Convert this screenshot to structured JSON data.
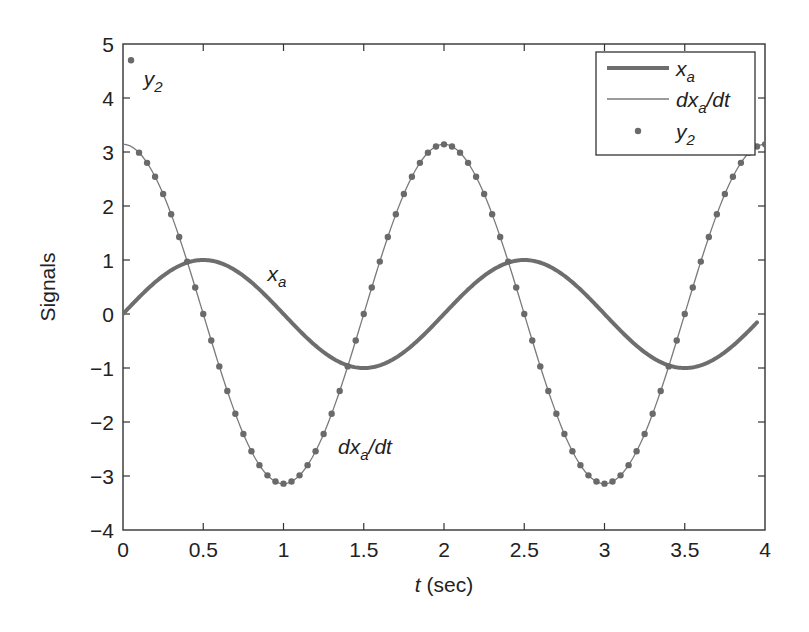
{
  "chart_data": {
    "type": "line",
    "title": "",
    "xlabel_var": "t",
    "xlabel_unit": " (sec)",
    "xlabel": "t (sec)",
    "ylabel": "Signals",
    "xlim": [
      0,
      4
    ],
    "ylim": [
      -4,
      5
    ],
    "grid": false,
    "legend_position": "upper right",
    "xticks": [
      0,
      0.5,
      1,
      1.5,
      2,
      2.5,
      3,
      3.5,
      4
    ],
    "xtick_labels": [
      "0",
      "0.5",
      "1",
      "1.5",
      "2",
      "2.5",
      "3",
      "3.5",
      "4"
    ],
    "yticks": [
      -4,
      -3,
      -2,
      -1,
      0,
      1,
      2,
      3,
      4,
      5
    ],
    "ytick_labels": [
      "−4",
      "−3",
      "−2",
      "−1",
      "0",
      "1",
      "2",
      "3",
      "4",
      "5"
    ],
    "series": [
      {
        "name": "x_a",
        "label_main": "x",
        "label_sub": "a",
        "label_tail": "",
        "style": "thick-line",
        "color": "#6e6e6e",
        "width": 4,
        "formula": "sin(pi*t)",
        "t_range": [
          0,
          3.95
        ],
        "x": [
          0,
          0.25,
          0.5,
          0.75,
          1.0,
          1.25,
          1.5,
          1.75,
          2.0,
          2.25,
          2.5,
          2.75,
          3.0,
          3.25,
          3.5,
          3.75,
          3.95
        ],
        "values": [
          0,
          0.71,
          1.0,
          0.71,
          0,
          -0.71,
          -1.0,
          -0.71,
          0,
          0.71,
          1.0,
          0.71,
          0,
          -0.71,
          -1.0,
          -0.71,
          -0.16
        ]
      },
      {
        "name": "dx_a/dt",
        "label_main": "dx",
        "label_sub": "a",
        "label_tail": "/dt",
        "style": "thin-line",
        "color": "#7a7a7a",
        "width": 1.3,
        "formula": "pi*cos(pi*t)",
        "t_range": [
          0,
          4
        ],
        "x": [
          0,
          0.25,
          0.5,
          0.75,
          1.0,
          1.25,
          1.5,
          1.75,
          2.0,
          2.25,
          2.5,
          2.75,
          3.0,
          3.25,
          3.5,
          3.75,
          4.0
        ],
        "values": [
          3.14,
          2.22,
          0,
          -2.22,
          -3.14,
          -2.22,
          0,
          2.22,
          3.14,
          2.22,
          0,
          -2.22,
          -3.14,
          -2.22,
          0,
          2.22,
          3.14
        ]
      },
      {
        "name": "y_2",
        "label_main": "y",
        "label_sub": "2",
        "label_tail": "",
        "style": "dots",
        "color": "#6a6a6a",
        "radius": 3.2,
        "sample_dt": 0.05,
        "first_point": {
          "t": 0.05,
          "value": 4.7
        },
        "formula_after_first": "pi*cos(pi*t)",
        "t_range": [
          0.05,
          4.0
        ]
      }
    ],
    "annotations": [
      {
        "text_main": "y",
        "text_sub": "2",
        "text_tail": "",
        "t": 0.13,
        "value": 4.22
      },
      {
        "text_main": "x",
        "text_sub": "a",
        "text_tail": "",
        "t": 0.9,
        "value": 0.62
      },
      {
        "text_main": "dx",
        "text_sub": "a",
        "text_tail": "/dt",
        "t": 1.34,
        "value": -2.6
      }
    ]
  }
}
